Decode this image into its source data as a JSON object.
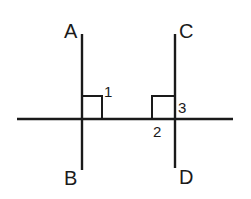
{
  "diagram": {
    "colors": {
      "stroke": "#1a1a1a",
      "background": "#ffffff"
    },
    "points": {
      "A": "A",
      "B": "B",
      "C": "C",
      "D": "D"
    },
    "angles": {
      "angle1": "1",
      "angle2": "2",
      "angle3": "3"
    },
    "right_angle_marks": 2
  }
}
